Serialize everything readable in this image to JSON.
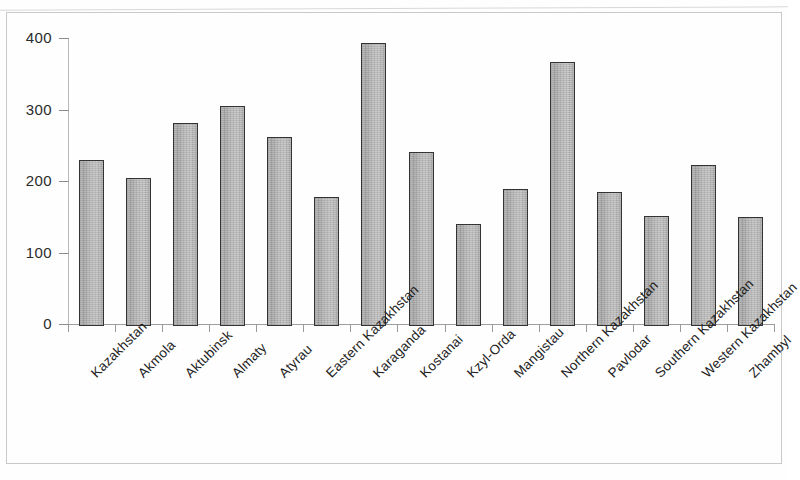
{
  "figure": {
    "name": "regional-bar-chart"
  },
  "chart_data": {
    "type": "bar",
    "title": "",
    "subtitle": "",
    "xlabel": "",
    "ylabel": "",
    "ylim": [
      0,
      400
    ],
    "yticks": [
      0,
      100,
      200,
      300,
      400
    ],
    "ytick_labels": [
      "0",
      "100",
      "200",
      "300",
      "400"
    ],
    "grid": false,
    "legend": null,
    "orientation": "vertical",
    "bar_style": {
      "fill": "#bcbcbc",
      "edge": "#333333",
      "texture": "grainy-gray-gradient"
    },
    "categories": [
      "Kazakhstan",
      "Akmola",
      "Aktubinsk",
      "Almaty",
      "Atyrau",
      "Eastern Kazakhstan",
      "Karaganda",
      "Kostanai",
      "Kzyl-Orda",
      "Mangistau",
      "Northern Kazakhstan",
      "Pavlodar",
      "Southern Kazakhstan",
      "Western Kazakhstan",
      "Zhambyl"
    ],
    "values": [
      232,
      207,
      284,
      308,
      264,
      180,
      396,
      243,
      142,
      192,
      369,
      187,
      154,
      225,
      152
    ]
  }
}
